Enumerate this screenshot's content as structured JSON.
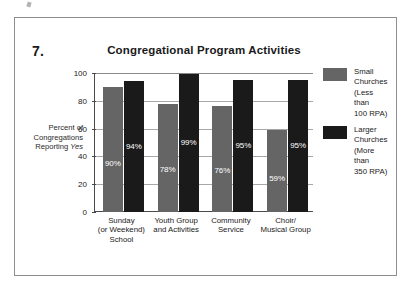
{
  "figure": {
    "number": "7.",
    "title": "Congregational Program Activities",
    "ylabel_line1": "Percent of",
    "ylabel_line2": "Congregations",
    "ylabel_line3": "Reporting ",
    "ylabel_emphasis": "Yes"
  },
  "legend": {
    "position": "right",
    "entries": [
      {
        "label": "Small\nChurches\n(Less than\n100 RPA)",
        "color": "#656565",
        "swatch_name": "legend-swatch-small-churches"
      },
      {
        "label": "Larger\nChurches\n(More than\n350 RPA)",
        "color": "#1a1a1a",
        "swatch_name": "legend-swatch-larger-churches"
      }
    ]
  },
  "axis": {
    "ytick_labels": [
      "100",
      "80",
      "60",
      "40",
      "20",
      "0"
    ]
  },
  "chart_data": {
    "type": "bar",
    "title": "Congregational Program Activities",
    "xlabel": "",
    "ylabel": "Percent of Congregations Reporting Yes",
    "ylim": [
      0,
      100
    ],
    "yticks": [
      0,
      20,
      40,
      60,
      80,
      100
    ],
    "grid": true,
    "legend_position": "right",
    "categories": [
      "Sunday\n(or Weekend)\nSchool",
      "Youth Group\nand Activities",
      "Community\nService",
      "Choir/\nMusical Group"
    ],
    "series": [
      {
        "name": "Small Churches (Less than 100 RPA)",
        "color": "#656565",
        "values": [
          90,
          78,
          76,
          59
        ],
        "labels": [
          "90%",
          "78%",
          "76%",
          "59%"
        ]
      },
      {
        "name": "Larger Churches (More than 350 RPA)",
        "color": "#1a1a1a",
        "values": [
          94,
          99,
          95,
          95
        ],
        "labels": [
          "94%",
          "99%",
          "95%",
          "95%"
        ]
      }
    ]
  }
}
